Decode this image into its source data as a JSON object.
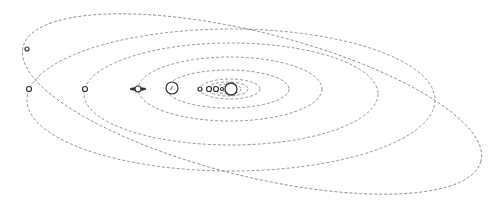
{
  "diagram": {
    "title": "",
    "background": "#ffffff",
    "orbit_color": "#8a8a8a",
    "body_color": "#333333",
    "sun": {
      "name": "sun",
      "cx": 231,
      "cy": 89,
      "r": 6
    },
    "orbits": [
      {
        "name": "mercury",
        "cx": 228,
        "cy": 89,
        "rx": 7,
        "ry": 3,
        "rotate": 0
      },
      {
        "name": "venus",
        "cx": 228,
        "cy": 89,
        "rx": 13,
        "ry": 5,
        "rotate": 0
      },
      {
        "name": "earth",
        "cx": 228,
        "cy": 89,
        "rx": 20,
        "ry": 7,
        "rotate": 0
      },
      {
        "name": "mars",
        "cx": 230,
        "cy": 89,
        "rx": 30,
        "ry": 10,
        "rotate": 0
      },
      {
        "name": "jupiter",
        "cx": 228,
        "cy": 89,
        "rx": 61,
        "ry": 19,
        "rotate": 0
      },
      {
        "name": "saturn",
        "cx": 230,
        "cy": 89,
        "rx": 92,
        "ry": 32,
        "rotate": 0
      },
      {
        "name": "uranus",
        "cx": 231,
        "cy": 94,
        "rx": 147,
        "ry": 51,
        "rotate": 0
      },
      {
        "name": "neptune",
        "cx": 231,
        "cy": 100,
        "rx": 204,
        "ry": 71,
        "rotate": 0
      },
      {
        "name": "pluto",
        "cx": 252,
        "cy": 104,
        "rx": 236,
        "ry": 72,
        "rotate": 14
      }
    ],
    "planets": [
      {
        "name": "mercury",
        "cx": 222,
        "cy": 89,
        "r": 1.5
      },
      {
        "name": "venus",
        "cx": 216,
        "cy": 89,
        "r": 2.5
      },
      {
        "name": "earth",
        "cx": 209,
        "cy": 89,
        "r": 2.5
      },
      {
        "name": "mars",
        "cx": 200,
        "cy": 89,
        "r": 2
      },
      {
        "name": "jupiter",
        "cx": 172,
        "cy": 88,
        "r": 6
      },
      {
        "name": "saturn",
        "cx": 138,
        "cy": 89,
        "r": 3
      },
      {
        "name": "uranus",
        "cx": 85,
        "cy": 89,
        "r": 2.5
      },
      {
        "name": "neptune",
        "cx": 29,
        "cy": 89,
        "r": 2.5
      },
      {
        "name": "pluto",
        "cx": 27,
        "cy": 49,
        "r": 2
      }
    ]
  }
}
